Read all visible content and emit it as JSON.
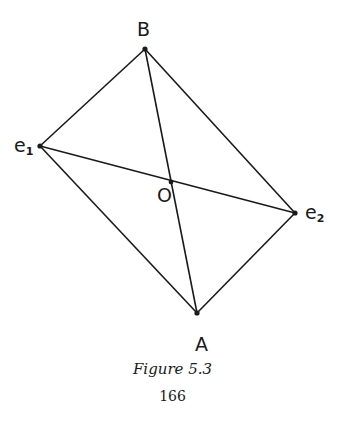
{
  "diagram": {
    "points": {
      "B": {
        "label": "B",
        "x": 145,
        "y": 49
      },
      "e1": {
        "label": "e",
        "sub": "1",
        "x": 40,
        "y": 146
      },
      "O": {
        "label": "O",
        "x": 171,
        "y": 182
      },
      "e2": {
        "label": "e",
        "sub": "2",
        "x": 295,
        "y": 213
      },
      "A": {
        "label": "A",
        "x": 197,
        "y": 313
      }
    },
    "edges": [
      [
        "B",
        "e1"
      ],
      [
        "B",
        "e2"
      ],
      [
        "e1",
        "A"
      ],
      [
        "e2",
        "A"
      ],
      [
        "B",
        "A"
      ],
      [
        "e1",
        "e2"
      ]
    ]
  },
  "caption": {
    "figure": "Figure 5.3",
    "page_number": "166"
  }
}
